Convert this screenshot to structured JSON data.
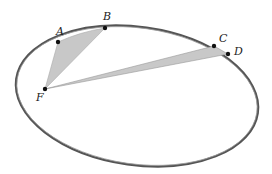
{
  "diagram": {
    "labels": {
      "A": "A",
      "B": "B",
      "C": "C",
      "D": "D",
      "F": "F"
    },
    "colors": {
      "orbit": "#444444",
      "sector": "#c8c8c8",
      "point": "#111111"
    }
  }
}
